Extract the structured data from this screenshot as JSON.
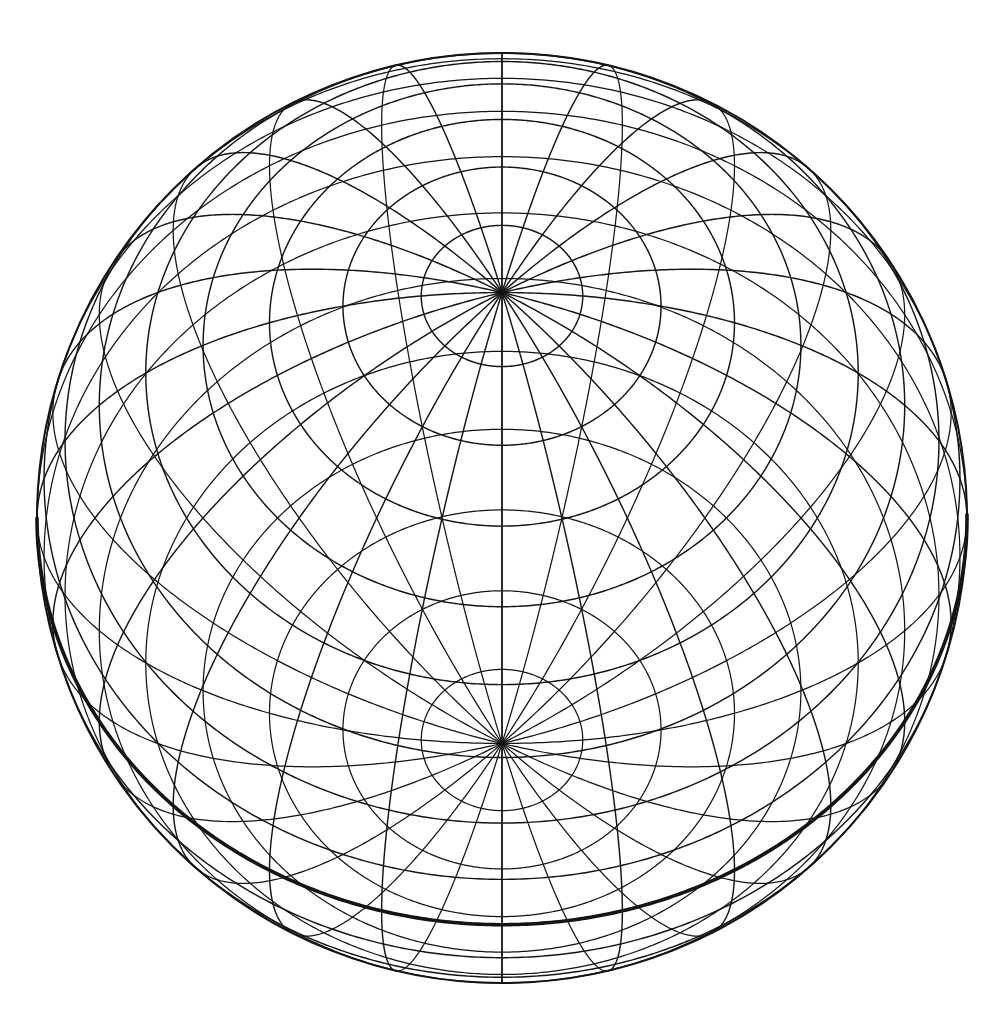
{
  "figure": {
    "name": "globe-graticule",
    "background_color": "#ffffff",
    "line_color": "#141414"
  },
  "chart_data": {
    "type": "scatter",
    "xlabel": "",
    "ylabel": "",
    "projection": "orthographic",
    "grid": true,
    "legend": false,
    "sphere": {
      "center_x": 502,
      "center_y": 518,
      "radius": 465,
      "outline_visible": true
    },
    "view": {
      "center_latitude": 61,
      "center_longitude": 0,
      "north_pole_visible": true,
      "south_pole_visible": false,
      "pole_pixel_x": 502,
      "pole_pixel_y": 283,
      "wireframe_transparent": true
    },
    "graticule": {
      "meridian_step_deg": 15,
      "meridian_count": 24,
      "parallel_step_deg": 10,
      "parallel_count": 17,
      "meridian_longitudes": [
        -180,
        -165,
        -150,
        -135,
        -120,
        -105,
        -90,
        -75,
        -60,
        -45,
        -30,
        -15,
        0,
        15,
        30,
        45,
        60,
        75,
        90,
        105,
        120,
        135,
        150,
        165
      ],
      "parallel_latitudes": [
        -80,
        -70,
        -60,
        -50,
        -40,
        -30,
        -20,
        -10,
        0,
        10,
        20,
        30,
        40,
        50,
        60,
        70,
        80
      ],
      "emphasized": {
        "label": "equator",
        "latitude": 0,
        "stroke_width": 3.6
      }
    },
    "measured_center_meridian_crossings_px": {
      "latitudes": [
        80,
        70,
        60,
        50,
        40,
        30,
        20,
        10,
        0,
        -10,
        -20,
        -30
      ],
      "y_pixels": [
        218,
        160,
        112,
        75,
        48,
        335,
        403,
        523,
        605,
        690,
        765,
        830
      ]
    }
  }
}
